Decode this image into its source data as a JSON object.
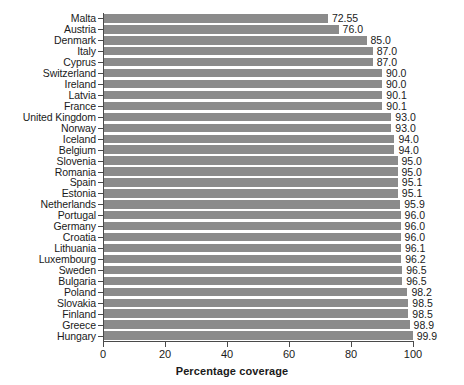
{
  "chart_data": {
    "type": "bar",
    "orientation": "horizontal",
    "title": "",
    "xlabel": "Percentage coverage",
    "ylabel": "",
    "xlim": [
      0,
      100
    ],
    "grid": false,
    "legend": null,
    "bar_color": "#8b8b8b",
    "axis_color": "#4a4a4a",
    "xticks": [
      0,
      20,
      40,
      60,
      80,
      100
    ],
    "xtick_labels": [
      "0",
      "20",
      "40",
      "60",
      "80",
      "100"
    ],
    "categories": [
      "Malta",
      "Austria",
      "Denmark",
      "Italy",
      "Cyprus",
      "Switzerland",
      "Ireland",
      "Latvia",
      "France",
      "United Kingdom",
      "Norway",
      "Iceland",
      "Belgium",
      "Slovenia",
      "Romania",
      "Spain",
      "Estonia",
      "Netherlands",
      "Portugal",
      "Germany",
      "Croatia",
      "Lithuania",
      "Luxembourg",
      "Sweden",
      "Bulgaria",
      "Poland",
      "Slovakia",
      "Finland",
      "Greece",
      "Hungary"
    ],
    "values": [
      72.55,
      76.0,
      85.0,
      87.0,
      87.0,
      90.0,
      90.0,
      90.1,
      90.1,
      93.0,
      93.0,
      94.0,
      94.0,
      95.0,
      95.0,
      95.1,
      95.1,
      95.9,
      96.0,
      96.0,
      96.0,
      96.1,
      96.2,
      96.5,
      96.5,
      98.2,
      98.5,
      98.5,
      98.9,
      99.9
    ],
    "value_labels": [
      "72.55",
      "76.0",
      "85.0",
      "87.0",
      "87.0",
      "90.0",
      "90.0",
      "90.1",
      "90.1",
      "93.0",
      "93.0",
      "94.0",
      "94.0",
      "95.0",
      "95.0",
      "95.1",
      "95.1",
      "95.9",
      "96.0",
      "96.0",
      "96.0",
      "96.1",
      "96.2",
      "96.5",
      "96.5",
      "98.2",
      "98.5",
      "98.5",
      "98.9",
      "99.9"
    ]
  }
}
